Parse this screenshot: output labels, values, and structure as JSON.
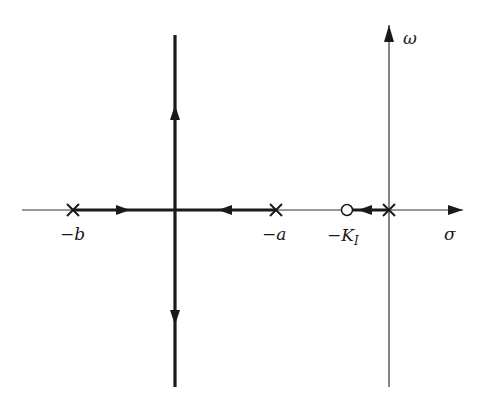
{
  "diagram": {
    "type": "root-locus",
    "axes": {
      "real_axis_label": "σ",
      "imag_axis_label": "ω"
    },
    "poles": [
      {
        "label": "−b",
        "position": "-b"
      },
      {
        "label": "−a",
        "position": "-a"
      },
      {
        "label": "",
        "position": "0"
      }
    ],
    "zeros": [
      {
        "label": "−K",
        "subscript": "I",
        "position": "-K_I"
      }
    ],
    "branches": [
      {
        "from": "-b",
        "to": "breakaway",
        "direction": "right"
      },
      {
        "from": "-a",
        "to": "breakaway",
        "direction": "left"
      },
      {
        "from": "breakaway",
        "to": "+j∞",
        "direction": "up"
      },
      {
        "from": "breakaway",
        "to": "-j∞",
        "direction": "down"
      },
      {
        "from": "0",
        "to": "-K_I",
        "direction": "left"
      }
    ]
  }
}
